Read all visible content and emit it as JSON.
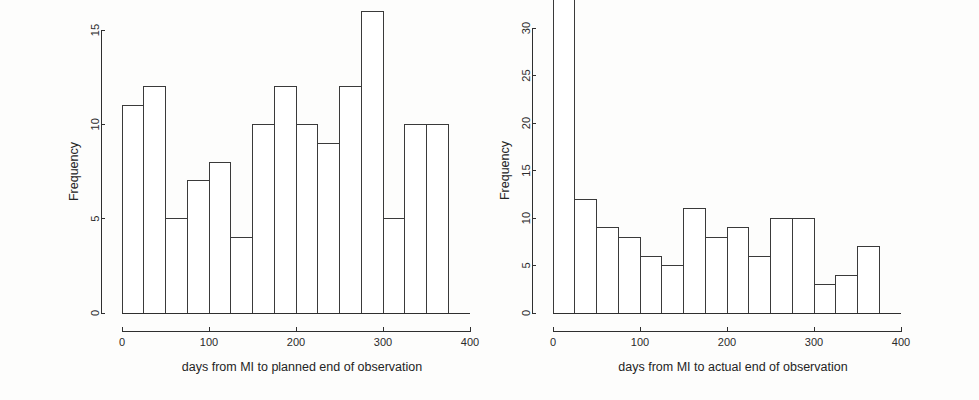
{
  "figure": {
    "background_color": "#fdfdfc",
    "ink_color": "#2f2f2f",
    "panel_count": 2
  },
  "chart_data": [
    {
      "id": "planned",
      "type": "bar",
      "subtype": "histogram",
      "title": "",
      "xlabel": "days from MI to planned end of observation",
      "ylabel": "Frequency",
      "bin_width": 25,
      "bin_edges": [
        0,
        25,
        50,
        75,
        100,
        125,
        150,
        175,
        200,
        225,
        250,
        275,
        300,
        325,
        350,
        375
      ],
      "categories": [
        "0-25",
        "25-50",
        "50-75",
        "75-100",
        "100-125",
        "125-150",
        "150-175",
        "175-200",
        "200-225",
        "225-250",
        "250-275",
        "275-300",
        "300-325",
        "325-350",
        "350-375"
      ],
      "values": [
        11,
        12,
        5,
        7,
        8,
        4,
        10,
        12,
        10,
        9,
        12,
        16,
        5,
        10,
        10
      ],
      "xlim": [
        0,
        400
      ],
      "ylim": [
        0,
        16
      ],
      "xticks": [
        0,
        100,
        200,
        300,
        400
      ],
      "xtick_labels": [
        "0",
        "100",
        "200",
        "300",
        "400"
      ],
      "yticks": [
        0,
        5,
        10,
        15
      ],
      "ytick_labels": [
        "0",
        "5",
        "10",
        "15"
      ],
      "grid": false,
      "legend": false
    },
    {
      "id": "actual",
      "type": "bar",
      "subtype": "histogram",
      "title": "",
      "xlabel": "days from MI to actual end of observation",
      "ylabel": "Frequency",
      "bin_width": 25,
      "bin_edges": [
        0,
        25,
        50,
        75,
        100,
        125,
        150,
        175,
        200,
        225,
        250,
        275,
        300,
        325,
        350,
        375
      ],
      "categories": [
        "0-25",
        "25-50",
        "50-75",
        "75-100",
        "100-125",
        "125-150",
        "150-175",
        "175-200",
        "200-225",
        "225-250",
        "250-275",
        "275-300",
        "300-325",
        "325-350",
        "350-375"
      ],
      "values": [
        33,
        12,
        9,
        8,
        6,
        5,
        11,
        8,
        9,
        6,
        10,
        10,
        3,
        4,
        7
      ],
      "xlim": [
        0,
        400
      ],
      "ylim": [
        0,
        33
      ],
      "xticks": [
        0,
        100,
        200,
        300,
        400
      ],
      "xtick_labels": [
        "0",
        "100",
        "200",
        "300",
        "400"
      ],
      "yticks": [
        0,
        5,
        10,
        15,
        20,
        25,
        30
      ],
      "ytick_labels": [
        "0",
        "5",
        "10",
        "15",
        "20",
        "25",
        "30"
      ],
      "grid": false,
      "legend": false
    }
  ]
}
